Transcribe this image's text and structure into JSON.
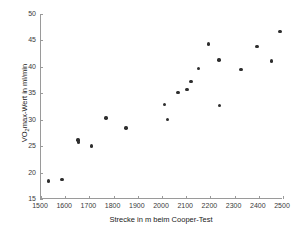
{
  "chart_data": {
    "type": "scatter",
    "title": "",
    "xlabel": "Strecke in m beim Cooper-Test",
    "ylabel_parts": {
      "pre": "VO",
      "sub": "2",
      "post": "max-Wert in ml/min"
    },
    "ylabel": "VO2max-Wert in ml/min",
    "xlim": [
      1500,
      2500
    ],
    "ylim": [
      15,
      50
    ],
    "xticks": [
      1500,
      1600,
      1700,
      1800,
      1900,
      2000,
      2100,
      2200,
      2300,
      2400,
      2500
    ],
    "yticks": [
      15,
      20,
      25,
      30,
      35,
      40,
      45,
      50
    ],
    "grid": false,
    "legend": false,
    "marker": {
      "shape": "circle",
      "color": "#2e2e2e",
      "size_px": 3.4
    },
    "points": [
      {
        "x": 1532,
        "y": 18.4
      },
      {
        "x": 1587,
        "y": 18.7
      },
      {
        "x": 1653,
        "y": 26.2
      },
      {
        "x": 1655,
        "y": 25.8
      },
      {
        "x": 1708,
        "y": 25.0
      },
      {
        "x": 1768,
        "y": 30.3
      },
      {
        "x": 1852,
        "y": 28.4
      },
      {
        "x": 2011,
        "y": 32.9
      },
      {
        "x": 2022,
        "y": 30.0
      },
      {
        "x": 2066,
        "y": 35.2
      },
      {
        "x": 2103,
        "y": 35.7
      },
      {
        "x": 2120,
        "y": 37.2
      },
      {
        "x": 2150,
        "y": 39.7
      },
      {
        "x": 2192,
        "y": 44.3
      },
      {
        "x": 2236,
        "y": 41.3
      },
      {
        "x": 2238,
        "y": 32.7
      },
      {
        "x": 2326,
        "y": 39.5
      },
      {
        "x": 2393,
        "y": 43.8
      },
      {
        "x": 2452,
        "y": 41.1
      },
      {
        "x": 2488,
        "y": 46.7
      }
    ]
  },
  "axis": {
    "line_color": "#9a9a9a",
    "tick_color": "#3a3a3a"
  }
}
